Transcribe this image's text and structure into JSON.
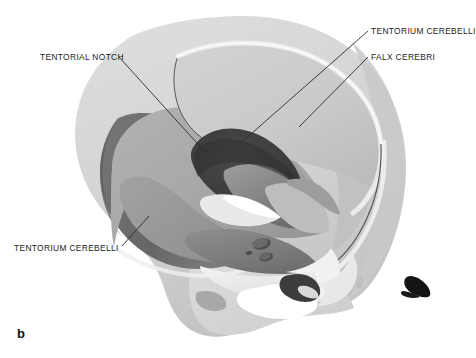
{
  "figure": {
    "letter": "b",
    "type": "anatomical-illustration",
    "background_color": "#ffffff"
  },
  "annotations": [
    {
      "id": "tentorium-cerebelli-top",
      "label": "TENTORIUM CEREBELLI",
      "text_anchor": "start",
      "leader_from": [
        368,
        31
      ],
      "leader_to": [
        243,
        141
      ]
    },
    {
      "id": "falx-cerebri",
      "label": "FALX CEREBRI",
      "text_anchor": "start",
      "leader_from": [
        368,
        57
      ],
      "leader_to": [
        299,
        127
      ]
    },
    {
      "id": "tentorial-notch",
      "label": "TENTORIAL NOTCH",
      "text_anchor": "end",
      "leader_from": [
        119,
        57
      ],
      "leader_to": [
        205,
        152
      ]
    },
    {
      "id": "tentorium-cerebelli-bottom",
      "label": "TENTORIUM CEREBELLI",
      "text_anchor": "end",
      "leader_from": [
        122,
        246
      ],
      "leader_to": [
        149,
        216
      ]
    }
  ],
  "palette": {
    "skull_outer": "#d5d6d6",
    "skull_outer_shadow": "#c2c3c4",
    "skull_bone_edge": "#f2f2f2",
    "skull_inner_line": "#4a4a4a",
    "posterior_fossa_dark": "#6d6d6d",
    "tentorium_surface": "#a9a9a9",
    "tentorium_shadow": "#8f8f90",
    "falx_surface": "#c9c9c9",
    "falx_upper": "#d0d0d0",
    "notch_dark": "#3f3f3f",
    "brainstem_mid": "#8a8a8a",
    "brainstem_dark": "#5e5e5e",
    "clivus_light": "#e8e8e8",
    "sinus_white": "#ffffff",
    "meatus_black": "#141414",
    "leader_line": "#2b2b2b",
    "label_text": "#1b1b1b"
  },
  "structures": [
    {
      "name": "cranial-vault-outer",
      "description": "Outer table of the skull, light grey dome"
    },
    {
      "name": "skull-cut-edge",
      "description": "Pale bevelled bone edge around the cut opening"
    },
    {
      "name": "posterior-fossa-wall",
      "description": "Dark grey inner surface of the posterior cranial fossa"
    },
    {
      "name": "falx-cerebri",
      "description": "Light grey sickle-shaped midline dural fold beneath the vault"
    },
    {
      "name": "tentorium-cerebelli",
      "description": "Mid-grey tent-like dural sheet over the posterior fossa"
    },
    {
      "name": "tentorial-notch",
      "description": "Dark oval opening in the free margin of the tentorium"
    },
    {
      "name": "midbrain-brainstem",
      "description": "Darker shaded structure passing through the notch"
    },
    {
      "name": "sella-and-clivus",
      "description": "Central skull base with sella turcica and clivus"
    },
    {
      "name": "sphenoid-sinus",
      "description": "White air-filled cavity in the skull base"
    },
    {
      "name": "external-acoustic-meatus",
      "description": "Small black triangular opening at the lower right"
    }
  ]
}
